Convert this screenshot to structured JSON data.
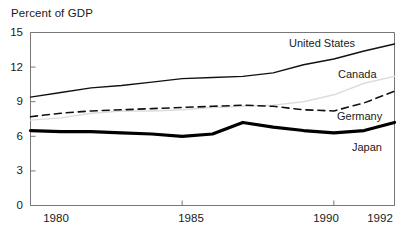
{
  "chart_data": {
    "type": "line",
    "title": "Percent of GDP",
    "xlabel": "",
    "ylabel": "",
    "xlim": [
      1980,
      1992
    ],
    "ylim": [
      0,
      15
    ],
    "yticks": [
      "0",
      "3",
      "6",
      "9",
      "12",
      "15"
    ],
    "ytick_values": [
      0,
      3,
      6,
      9,
      12,
      15
    ],
    "xticks": [
      "1980",
      "1985",
      "1990",
      "1992"
    ],
    "xtick_values": [
      1980,
      1985,
      1990,
      1992
    ],
    "grid": false,
    "legend_position": "inline-right",
    "x": [
      1980,
      1981,
      1982,
      1983,
      1984,
      1985,
      1986,
      1987,
      1988,
      1989,
      1990,
      1991,
      1992
    ],
    "series": [
      {
        "name": "United States",
        "style": "solid",
        "color": "#111111",
        "width": 1.4,
        "values": [
          9.4,
          9.8,
          10.2,
          10.4,
          10.7,
          11.0,
          11.1,
          11.2,
          11.5,
          12.2,
          12.7,
          13.4,
          14.0
        ]
      },
      {
        "name": "Canada",
        "style": "faint",
        "color": "#dcdcdc",
        "width": 1.4,
        "values": [
          7.4,
          7.6,
          8.0,
          8.2,
          8.2,
          8.3,
          8.5,
          8.6,
          8.7,
          9.0,
          9.6,
          10.6,
          11.2
        ]
      },
      {
        "name": "Germany",
        "style": "dashed",
        "color": "#111111",
        "width": 1.6,
        "values": [
          7.7,
          8.0,
          8.2,
          8.3,
          8.4,
          8.5,
          8.6,
          8.7,
          8.6,
          8.3,
          8.2,
          8.9,
          9.9
        ]
      },
      {
        "name": "Japan",
        "style": "thick",
        "color": "#000000",
        "width": 3.2,
        "values": [
          6.5,
          6.4,
          6.4,
          6.3,
          6.2,
          6.0,
          6.2,
          7.2,
          6.8,
          6.5,
          6.3,
          6.5,
          7.2
        ]
      }
    ],
    "annotations": [
      {
        "text": "United States",
        "x_px": 289,
        "y_px": 37
      },
      {
        "text": "Canada",
        "x_px": 338,
        "y_px": 68
      },
      {
        "text": "Germany",
        "x_px": 337,
        "y_px": 110
      },
      {
        "text": "Japan",
        "x_px": 352,
        "y_px": 141
      }
    ]
  },
  "axis": {
    "y_labels": [
      "15",
      "12",
      "9",
      "6",
      "3",
      "0"
    ],
    "x_labels": [
      "1980",
      "1985",
      "1990",
      "1992"
    ]
  }
}
